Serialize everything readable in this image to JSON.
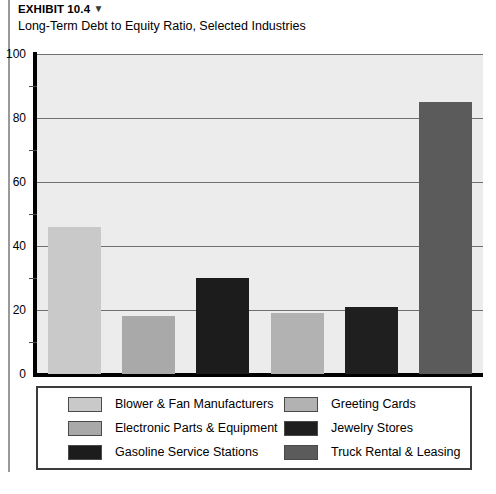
{
  "header": {
    "exhibit_label": "EXHIBIT 10.4",
    "exhibit_marker": "▼",
    "subtitle": "Long-Term Debt to Equity Ratio, Selected Industries"
  },
  "chart_data": {
    "type": "bar",
    "title": "Long-Term Debt to Equity Ratio, Selected Industries",
    "xlabel": "",
    "ylabel": "",
    "ylim": [
      0,
      100
    ],
    "ytick_labels": [
      "0",
      "20",
      "40",
      "60",
      "80",
      "100"
    ],
    "ytick_values": [
      0,
      20,
      40,
      60,
      80,
      100
    ],
    "minor_ticks": [
      10,
      30,
      50,
      70,
      90
    ],
    "grid": true,
    "legend_position": "bottom",
    "categories": [
      "Blower & Fan Manufacturers",
      "Electronic Parts & Equipment",
      "Gasoline Service Stations",
      "Greeting Cards",
      "Jewelry Stores",
      "Truck Rental & Leasing"
    ],
    "values": [
      46,
      18,
      30,
      19,
      21,
      85
    ],
    "colors": [
      "#c9c9ca",
      "#a9a9aa",
      "#1c1c1c",
      "#b2b2b3",
      "#1f1f1f",
      "#5b5b5c"
    ],
    "plot_background": "#ececed"
  },
  "legend": {
    "items": [
      {
        "label": "Blower & Fan Manufacturers",
        "color": "#c9c9ca"
      },
      {
        "label": "Electronic Parts & Equipment",
        "color": "#a9a9aa"
      },
      {
        "label": "Gasoline Service Stations",
        "color": "#1c1c1c"
      },
      {
        "label": "Greeting Cards",
        "color": "#b2b2b3"
      },
      {
        "label": "Jewelry Stores",
        "color": "#1f1f1f"
      },
      {
        "label": "Truck Rental & Leasing",
        "color": "#5b5b5c"
      }
    ]
  }
}
